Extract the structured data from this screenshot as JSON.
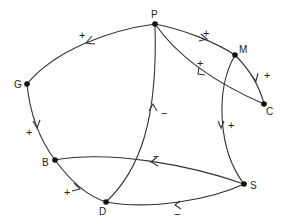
{
  "diagram": {
    "type": "signed-digraph",
    "nodes": [
      {
        "id": "P",
        "label": "P",
        "x": 155,
        "y": 24
      },
      {
        "id": "M",
        "label": "M",
        "x": 235,
        "y": 55
      },
      {
        "id": "C",
        "label": "C",
        "x": 264,
        "y": 104
      },
      {
        "id": "G",
        "label": "G",
        "x": 27,
        "y": 84
      },
      {
        "id": "B",
        "label": "B",
        "x": 55,
        "y": 160
      },
      {
        "id": "D",
        "label": "D",
        "x": 106,
        "y": 202
      },
      {
        "id": "S",
        "label": "S",
        "x": 244,
        "y": 184
      }
    ],
    "edges": [
      {
        "from": "P",
        "to": "G",
        "sign": "+"
      },
      {
        "from": "G",
        "to": "B",
        "sign": "+"
      },
      {
        "from": "B",
        "to": "D",
        "sign": "+"
      },
      {
        "from": "D",
        "to": "P",
        "sign": "−"
      },
      {
        "from": "P",
        "to": "M",
        "sign": "+"
      },
      {
        "from": "M",
        "to": "C",
        "sign": "+"
      },
      {
        "from": "C",
        "to": "P",
        "sign": "+"
      },
      {
        "from": "M",
        "to": "S",
        "sign": "+"
      },
      {
        "from": "S",
        "to": "B",
        "sign": "−"
      },
      {
        "from": "S",
        "to": "D",
        "sign": "−"
      }
    ]
  },
  "labels": {
    "P": "P",
    "M": "M",
    "C": "C",
    "G": "G",
    "B": "B",
    "D": "D",
    "S": "S"
  },
  "signs": {
    "PG": "+",
    "GB": "+",
    "BD": "+",
    "DP": "−",
    "PM": "+",
    "MC": "+",
    "CP": "+",
    "MS": "+",
    "SB": "−",
    "SD": "−"
  }
}
